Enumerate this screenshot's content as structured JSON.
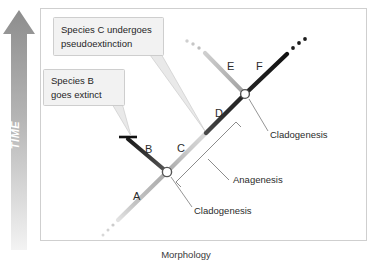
{
  "figure": {
    "axis_y_label": "TIME",
    "axis_x_label": "Morphology"
  },
  "callouts": [
    {
      "name": "species-c-callout",
      "line1": "Species C undergoes",
      "line2": "pseudoextinction"
    },
    {
      "name": "species-b-callout",
      "line1": "Species B",
      "line2": "goes extinct"
    }
  ],
  "branches": [
    {
      "id": "A",
      "label": "A",
      "color": "#b9b9b9"
    },
    {
      "id": "B",
      "label": "B",
      "color": "#3a3a3a"
    },
    {
      "id": "C",
      "label": "C",
      "color": "#c6c6c6"
    },
    {
      "id": "D",
      "label": "D",
      "color": "#2e2e2e"
    },
    {
      "id": "E",
      "label": "E",
      "color": "#b2b2b2"
    },
    {
      "id": "F",
      "label": "F",
      "color": "#1c1c1c"
    }
  ],
  "annotations": [
    {
      "name": "cladogenesis-upper",
      "text": "Cladogenesis"
    },
    {
      "name": "anagenesis",
      "text": "Anagenesis"
    },
    {
      "name": "cladogenesis-lower",
      "text": "Cladogenesis"
    }
  ],
  "colors": {
    "frame_border": "#cfcfcf",
    "callout_fill": "#f2f2f2",
    "callout_border": "#c8c8c8",
    "node_fill": "#ffffff",
    "node_stroke": "#555555",
    "time_arrow_top": "#8d8d8d",
    "time_arrow_bottom": "#efefef",
    "leader_line": "#7a7a7a",
    "text": "#2b2b2b"
  }
}
